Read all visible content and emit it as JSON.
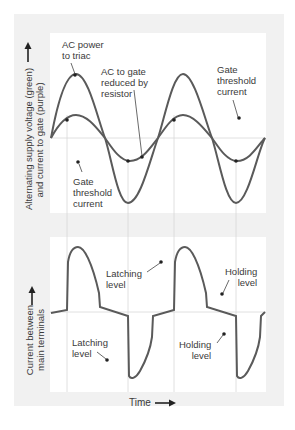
{
  "top_panel": {
    "y_axis_label_line1": "Alternating supply voltage (green)",
    "y_axis_label_line2": "and current to gate (purple)",
    "annotations": {
      "ac_power": [
        "AC power",
        "to triac"
      ],
      "ac_gate": [
        "AC to gate",
        "reduced by",
        "resistor"
      ],
      "gate_threshold_right": [
        "Gate",
        "threshold",
        "current"
      ],
      "gate_threshold_left": [
        "Gate",
        "threshold",
        "current"
      ]
    },
    "series": [
      {
        "name": "Alternating supply voltage",
        "color": "#5a5a5a",
        "amplitude": "large"
      },
      {
        "name": "Current to gate",
        "color": "#5a5a5a",
        "amplitude": "small"
      }
    ]
  },
  "bottom_panel": {
    "y_axis_label_line1": "Current between",
    "y_axis_label_line2": "main terminals",
    "annotations": {
      "latching_upper": [
        "Latching",
        "level"
      ],
      "holding_upper": [
        "Holding",
        "level"
      ],
      "latching_lower": [
        "Latching",
        "level"
      ],
      "holding_lower": [
        "Holding",
        "level"
      ]
    }
  },
  "x_axis_label": "Time",
  "colors": {
    "curve": "#5a5a5a",
    "grid": "#d8d8d8",
    "frame": "#f1f1f1"
  }
}
